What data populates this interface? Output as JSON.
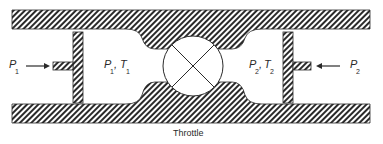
{
  "diagram": {
    "title": "Throttle",
    "left_side": {
      "force_label": "P",
      "force_sub": "1",
      "state_label_p": "P",
      "state_sub_p": "1",
      "state_label_t": "T",
      "state_sub_t": "1",
      "separator": ","
    },
    "right_side": {
      "force_label": "P",
      "force_sub": "2",
      "state_label_p": "P",
      "state_sub_p": "2",
      "state_label_t": "T",
      "state_sub_t": "2",
      "separator": ","
    },
    "caption": "Throttle",
    "colors": {
      "stroke": "#2a2a2a",
      "fill": "#ffffff"
    }
  }
}
